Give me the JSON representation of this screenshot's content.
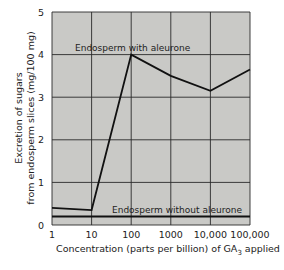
{
  "chart_data": {
    "type": "line",
    "title": "",
    "xlabel": "Concentration (parts per billion) of GA3 applied",
    "xlabel_parts": {
      "main": "Concentration (parts per billion) of GA",
      "sub": "3",
      "tail": " applied"
    },
    "ylabel_line1": "Excretion of sugars",
    "ylabel_line2": "from endosperm slices (mg/100 mg)",
    "x_scale": "log",
    "categories": [
      "1",
      "10",
      "100",
      "1000",
      "10,000",
      "100,000"
    ],
    "x": [
      1,
      10,
      100,
      1000,
      10000,
      100000
    ],
    "y_ticks": [
      "0",
      "1",
      "2",
      "3",
      "4",
      "5"
    ],
    "ylim": [
      0,
      5
    ],
    "grid": true,
    "series": [
      {
        "name": "Endosperm with aleurone",
        "values": [
          0.4,
          0.35,
          4.0,
          3.5,
          3.15,
          3.65
        ]
      },
      {
        "name": "Endosperm without aleurone",
        "values": [
          0.2,
          0.2,
          0.2,
          0.2,
          0.2,
          0.2
        ]
      }
    ],
    "annotations": [
      {
        "text": "Endosperm with aleurone",
        "near_series": 0
      },
      {
        "text": "Endosperm without aleurone",
        "near_series": 1
      }
    ],
    "colors": {
      "plot_bg": "#c9c9c6",
      "grid": "#2a2a2a",
      "line": "#111111"
    }
  }
}
